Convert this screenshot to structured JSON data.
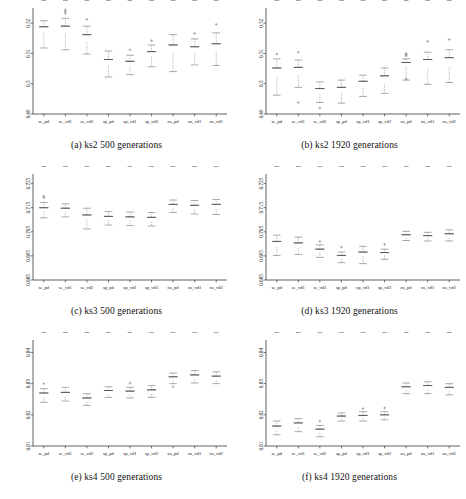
{
  "figure": {
    "type": "boxplot-grid",
    "rows": 3,
    "cols": 2,
    "style": "grayscale notched box-and-whisker"
  },
  "categories": [
    "se_pd",
    "se_vd1",
    "se_vd2",
    "sp_pd",
    "sp_vd1",
    "sp_vd2",
    "ns_pd",
    "ns_vd1",
    "ns_vd2"
  ],
  "chart_data": [
    {
      "type": "bar",
      "id": "a",
      "title": "(a) ks2 500 generations",
      "xlabel": "",
      "ylabel": "",
      "ylim": [
        0.49,
        0.525
      ],
      "yticks": [
        0.49,
        0.5,
        0.51,
        0.52
      ],
      "ytick_labels": [
        "0.49",
        "0.5",
        "0.51",
        "0.52"
      ],
      "grid": false,
      "legend": "none",
      "categories": [
        "se_pd",
        "se_vd1",
        "se_vd2",
        "sp_pd",
        "sp_vd1",
        "sp_vd2",
        "ns_pd",
        "ns_vd1",
        "ns_vd2"
      ],
      "values": [
        0.518,
        0.5178,
        0.515,
        0.5068,
        0.5065,
        0.5098,
        0.5113,
        0.511,
        0.5118
      ],
      "boxes": [
        {
          "category": "se_pd",
          "min": 0.5118,
          "q1": 0.5172,
          "median": 0.518,
          "q3": 0.5188,
          "max": 0.5208,
          "outliers": []
        },
        {
          "category": "se_vd1",
          "min": 0.5112,
          "q1": 0.5166,
          "median": 0.5178,
          "q3": 0.519,
          "max": 0.5216,
          "outliers": [
            0.5232,
            0.5238,
            0.5244
          ]
        },
        {
          "category": "se_vd2",
          "min": 0.5098,
          "q1": 0.5138,
          "median": 0.515,
          "q3": 0.5162,
          "max": 0.519,
          "outliers": [
            0.5212
          ]
        },
        {
          "category": "sp_pd",
          "min": 0.5022,
          "q1": 0.5058,
          "median": 0.5068,
          "q3": 0.508,
          "max": 0.5108,
          "outliers": []
        },
        {
          "category": "sp_vd1",
          "min": 0.503,
          "q1": 0.5056,
          "median": 0.5065,
          "q3": 0.5074,
          "max": 0.5094,
          "outliers": [
            0.5112
          ]
        },
        {
          "category": "sp_vd2",
          "min": 0.5056,
          "q1": 0.509,
          "median": 0.5098,
          "q3": 0.5106,
          "max": 0.5128,
          "outliers": [
            0.5142
          ]
        },
        {
          "category": "ns_pd",
          "min": 0.504,
          "q1": 0.51,
          "median": 0.5113,
          "q3": 0.5128,
          "max": 0.5162,
          "outliers": []
        },
        {
          "category": "ns_vd1",
          "min": 0.5062,
          "q1": 0.51,
          "median": 0.511,
          "q3": 0.5122,
          "max": 0.5148,
          "outliers": [
            0.5166
          ]
        },
        {
          "category": "ns_vd2",
          "min": 0.506,
          "q1": 0.5104,
          "median": 0.5118,
          "q3": 0.5132,
          "max": 0.5168,
          "outliers": [
            0.5196
          ]
        }
      ]
    },
    {
      "type": "bar",
      "id": "b",
      "title": "(b) ks2 1920 generations",
      "xlabel": "",
      "ylabel": "",
      "ylim": [
        0.49,
        0.525
      ],
      "yticks": [
        0.49,
        0.5,
        0.51,
        0.52
      ],
      "ytick_labels": [
        "0.49",
        "0.5",
        "0.51",
        "0.52"
      ],
      "grid": false,
      "legend": "none",
      "categories": [
        "se_pd",
        "se_vd1",
        "se_vd2",
        "sp_pd",
        "sp_vd1",
        "sp_vd2",
        "ns_pd",
        "ns_vd1",
        "ns_vd2"
      ],
      "values": [
        0.5038,
        0.5042,
        0.4975,
        0.4978,
        0.4995,
        0.501,
        0.5062,
        0.5065,
        0.5072
      ],
      "boxes": [
        {
          "category": "se_pd",
          "min": 0.4962,
          "q1": 0.5022,
          "median": 0.5038,
          "q3": 0.5052,
          "max": 0.5082,
          "outliers": [
            0.5098
          ]
        },
        {
          "category": "se_vd1",
          "min": 0.4988,
          "q1": 0.5028,
          "median": 0.5042,
          "q3": 0.5054,
          "max": 0.5078,
          "outliers": [
            0.5104,
            0.4938
          ]
        },
        {
          "category": "se_vd2",
          "min": 0.4938,
          "q1": 0.4966,
          "median": 0.4975,
          "q3": 0.4984,
          "max": 0.5006,
          "outliers": [
            0.492
          ]
        },
        {
          "category": "sp_pd",
          "min": 0.4936,
          "q1": 0.497,
          "median": 0.4978,
          "q3": 0.4988,
          "max": 0.5012,
          "outliers": []
        },
        {
          "category": "sp_vd1",
          "min": 0.4958,
          "q1": 0.4986,
          "median": 0.4995,
          "q3": 0.5008,
          "max": 0.5028,
          "outliers": []
        },
        {
          "category": "sp_vd2",
          "min": 0.4968,
          "q1": 0.4998,
          "median": 0.501,
          "q3": 0.5026,
          "max": 0.5052,
          "outliers": []
        },
        {
          "category": "ns_pd",
          "min": 0.5012,
          "q1": 0.5054,
          "median": 0.5062,
          "q3": 0.507,
          "max": 0.5082,
          "outliers": [
            0.5092,
            0.5096,
            0.51,
            0.5016
          ]
        },
        {
          "category": "ns_vd1",
          "min": 0.4998,
          "q1": 0.5048,
          "median": 0.5065,
          "q3": 0.508,
          "max": 0.5104,
          "outliers": [
            0.514
          ]
        },
        {
          "category": "ns_vd2",
          "min": 0.5004,
          "q1": 0.5054,
          "median": 0.5072,
          "q3": 0.5086,
          "max": 0.5112,
          "outliers": [
            0.5146
          ]
        }
      ]
    },
    {
      "type": "bar",
      "id": "c",
      "title": "(c) ks3 500 generations",
      "xlabel": "",
      "ylabel": "",
      "ylim": [
        0.685,
        0.729
      ],
      "yticks": [
        0.685,
        0.695,
        0.705,
        0.715,
        0.725
      ],
      "ytick_labels": [
        "0.685",
        "0.695",
        "0.705",
        "0.715",
        "0.725"
      ],
      "grid": false,
      "legend": "none",
      "categories": [
        "se_pd",
        "se_vd1",
        "se_vd2",
        "sp_pd",
        "sp_vd1",
        "sp_vd2",
        "ns_pd",
        "ns_vd1",
        "ns_vd2"
      ],
      "values": [
        0.7142,
        0.714,
        0.711,
        0.7106,
        0.7104,
        0.71,
        0.7156,
        0.7152,
        0.7154
      ],
      "boxes": [
        {
          "category": "se_pd",
          "min": 0.7108,
          "q1": 0.7134,
          "median": 0.7142,
          "q3": 0.715,
          "max": 0.7172,
          "outliers": [
            0.7192,
            0.7198
          ]
        },
        {
          "category": "se_vd1",
          "min": 0.7112,
          "q1": 0.7132,
          "median": 0.714,
          "q3": 0.7148,
          "max": 0.7166,
          "outliers": []
        },
        {
          "category": "se_vd2",
          "min": 0.7062,
          "q1": 0.71,
          "median": 0.711,
          "q3": 0.712,
          "max": 0.7148,
          "outliers": []
        },
        {
          "category": "sp_pd",
          "min": 0.7078,
          "q1": 0.7098,
          "median": 0.7106,
          "q3": 0.7114,
          "max": 0.7134,
          "outliers": []
        },
        {
          "category": "sp_vd1",
          "min": 0.7076,
          "q1": 0.7096,
          "median": 0.7104,
          "q3": 0.7112,
          "max": 0.7132,
          "outliers": []
        },
        {
          "category": "sp_vd2",
          "min": 0.7074,
          "q1": 0.7092,
          "median": 0.71,
          "q3": 0.711,
          "max": 0.713,
          "outliers": []
        },
        {
          "category": "ns_pd",
          "min": 0.713,
          "q1": 0.7148,
          "median": 0.7156,
          "q3": 0.7164,
          "max": 0.7182,
          "outliers": []
        },
        {
          "category": "ns_vd1",
          "min": 0.7124,
          "q1": 0.7144,
          "median": 0.7152,
          "q3": 0.716,
          "max": 0.718,
          "outliers": []
        },
        {
          "category": "ns_vd2",
          "min": 0.7122,
          "q1": 0.7144,
          "median": 0.7154,
          "q3": 0.7164,
          "max": 0.7184,
          "outliers": []
        }
      ]
    },
    {
      "type": "bar",
      "id": "d",
      "title": "(d) ks3 1920 generations",
      "xlabel": "",
      "ylabel": "",
      "ylim": [
        0.685,
        0.729
      ],
      "yticks": [
        0.685,
        0.695,
        0.705,
        0.715,
        0.725
      ],
      "ytick_labels": [
        "0.685",
        "0.695",
        "0.705",
        "0.715",
        "0.725"
      ],
      "grid": false,
      "legend": "none",
      "categories": [
        "se_pd",
        "se_vd1",
        "se_vd2",
        "sp_pd",
        "sp_vd1",
        "sp_vd2",
        "ns_pd",
        "ns_vd1",
        "ns_vd2"
      ],
      "values": [
        0.6998,
        0.6994,
        0.697,
        0.6944,
        0.6956,
        0.6958,
        0.7032,
        0.7028,
        0.7034
      ],
      "boxes": [
        {
          "category": "se_pd",
          "min": 0.6952,
          "q1": 0.6986,
          "median": 0.6998,
          "q3": 0.701,
          "max": 0.7036,
          "outliers": []
        },
        {
          "category": "se_vd1",
          "min": 0.6956,
          "q1": 0.6984,
          "median": 0.6994,
          "q3": 0.7004,
          "max": 0.7028,
          "outliers": []
        },
        {
          "category": "se_vd2",
          "min": 0.6944,
          "q1": 0.6964,
          "median": 0.697,
          "q3": 0.6978,
          "max": 0.6996,
          "outliers": [
            0.701
          ]
        },
        {
          "category": "sp_pd",
          "min": 0.6922,
          "q1": 0.6936,
          "median": 0.6944,
          "q3": 0.6952,
          "max": 0.6966,
          "outliers": [
            0.6986
          ]
        },
        {
          "category": "sp_vd1",
          "min": 0.6918,
          "q1": 0.6948,
          "median": 0.6956,
          "q3": 0.6966,
          "max": 0.699,
          "outliers": []
        },
        {
          "category": "sp_vd2",
          "min": 0.6936,
          "q1": 0.6952,
          "median": 0.6958,
          "q3": 0.6964,
          "max": 0.6978,
          "outliers": [
            0.6998
          ]
        },
        {
          "category": "ns_pd",
          "min": 0.7014,
          "q1": 0.7026,
          "median": 0.7032,
          "q3": 0.7038,
          "max": 0.7052,
          "outliers": []
        },
        {
          "category": "ns_vd1",
          "min": 0.7012,
          "q1": 0.7022,
          "median": 0.7028,
          "q3": 0.7034,
          "max": 0.7048,
          "outliers": []
        },
        {
          "category": "ns_vd2",
          "min": 0.7012,
          "q1": 0.7026,
          "median": 0.7034,
          "q3": 0.7042,
          "max": 0.7058,
          "outliers": []
        }
      ]
    },
    {
      "type": "bar",
      "id": "e",
      "title": "(e) ks4 500 generations",
      "xlabel": "",
      "ylabel": "",
      "ylim": [
        0.81,
        0.844
      ],
      "yticks": [
        0.81,
        0.82,
        0.83,
        0.84
      ],
      "ytick_labels": [
        "0.81",
        "0.82",
        "0.83",
        "0.84"
      ],
      "grid": false,
      "legend": "none",
      "categories": [
        "se_pd",
        "se_vd1",
        "se_vd2",
        "sp_pd",
        "sp_vd1",
        "sp_vd2",
        "ns_pd",
        "ns_vd1",
        "ns_vd2"
      ],
      "values": [
        0.8262,
        0.8264,
        0.8248,
        0.8272,
        0.827,
        0.8272,
        0.8316,
        0.832,
        0.8316
      ],
      "boxes": [
        {
          "category": "se_pd",
          "min": 0.824,
          "q1": 0.8256,
          "median": 0.8262,
          "q3": 0.827,
          "max": 0.8284,
          "outliers": [
            0.83
          ]
        },
        {
          "category": "se_vd1",
          "min": 0.8244,
          "q1": 0.8258,
          "median": 0.8264,
          "q3": 0.8272,
          "max": 0.8288,
          "outliers": []
        },
        {
          "category": "se_vd2",
          "min": 0.823,
          "q1": 0.8242,
          "median": 0.8248,
          "q3": 0.8254,
          "max": 0.8268,
          "outliers": []
        },
        {
          "category": "sp_pd",
          "min": 0.8256,
          "q1": 0.8266,
          "median": 0.8272,
          "q3": 0.8278,
          "max": 0.829,
          "outliers": []
        },
        {
          "category": "sp_vd1",
          "min": 0.8254,
          "q1": 0.8264,
          "median": 0.827,
          "q3": 0.8276,
          "max": 0.8288,
          "outliers": [
            0.8302
          ]
        },
        {
          "category": "sp_vd2",
          "min": 0.8256,
          "q1": 0.8266,
          "median": 0.8272,
          "q3": 0.828,
          "max": 0.8294,
          "outliers": []
        },
        {
          "category": "ns_pd",
          "min": 0.83,
          "q1": 0.831,
          "median": 0.8316,
          "q3": 0.8322,
          "max": 0.8334,
          "outliers": [
            0.829
          ]
        },
        {
          "category": "ns_vd1",
          "min": 0.8302,
          "q1": 0.8312,
          "median": 0.832,
          "q3": 0.8328,
          "max": 0.8342,
          "outliers": []
        },
        {
          "category": "ns_vd2",
          "min": 0.83,
          "q1": 0.831,
          "median": 0.8316,
          "q3": 0.8324,
          "max": 0.8338,
          "outliers": []
        }
      ]
    },
    {
      "type": "bar",
      "id": "f",
      "title": "(f) ks4 1920 generations",
      "xlabel": "",
      "ylabel": "",
      "ylim": [
        0.81,
        0.844
      ],
      "yticks": [
        0.81,
        0.82,
        0.83,
        0.84
      ],
      "ytick_labels": [
        "0.81",
        "0.82",
        "0.83",
        "0.84"
      ],
      "grid": false,
      "legend": "none",
      "categories": [
        "se_pd",
        "se_vd1",
        "se_vd2",
        "sp_pd",
        "sp_vd1",
        "sp_vd2",
        "ns_pd",
        "ns_vd1",
        "ns_vd2"
      ],
      "values": [
        0.8156,
        0.8166,
        0.8148,
        0.8192,
        0.8194,
        0.8196,
        0.8284,
        0.8286,
        0.8282
      ],
      "boxes": [
        {
          "category": "se_pd",
          "min": 0.8136,
          "q1": 0.8148,
          "median": 0.8156,
          "q3": 0.8164,
          "max": 0.818,
          "outliers": []
        },
        {
          "category": "se_vd1",
          "min": 0.8146,
          "q1": 0.816,
          "median": 0.8166,
          "q3": 0.8174,
          "max": 0.8188,
          "outliers": []
        },
        {
          "category": "se_vd2",
          "min": 0.813,
          "q1": 0.8142,
          "median": 0.8148,
          "q3": 0.8154,
          "max": 0.8166,
          "outliers": [
            0.818
          ]
        },
        {
          "category": "sp_pd",
          "min": 0.818,
          "q1": 0.8188,
          "median": 0.8192,
          "q3": 0.8196,
          "max": 0.8206,
          "outliers": []
        },
        {
          "category": "sp_vd1",
          "min": 0.818,
          "q1": 0.819,
          "median": 0.8194,
          "q3": 0.8198,
          "max": 0.821,
          "outliers": [
            0.822
          ]
        },
        {
          "category": "sp_vd2",
          "min": 0.8184,
          "q1": 0.8192,
          "median": 0.8196,
          "q3": 0.82,
          "max": 0.821,
          "outliers": [
            0.8222
          ]
        },
        {
          "category": "ns_pd",
          "min": 0.8268,
          "q1": 0.8278,
          "median": 0.8284,
          "q3": 0.829,
          "max": 0.8302,
          "outliers": []
        },
        {
          "category": "ns_vd1",
          "min": 0.8268,
          "q1": 0.828,
          "median": 0.8286,
          "q3": 0.8294,
          "max": 0.8306,
          "outliers": []
        },
        {
          "category": "ns_vd2",
          "min": 0.8264,
          "q1": 0.8276,
          "median": 0.8282,
          "q3": 0.8288,
          "max": 0.83,
          "outliers": []
        }
      ]
    }
  ]
}
